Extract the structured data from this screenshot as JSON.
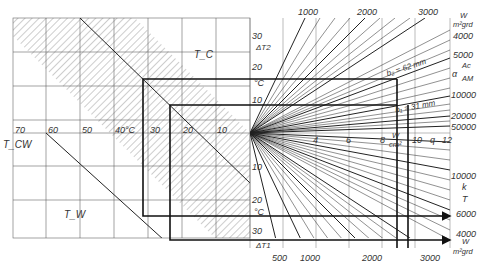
{
  "diagram": {
    "type": "nomogram",
    "left_panel": {
      "x_axis_ticks": [
        "70",
        "60",
        "50",
        "40°C",
        "30",
        "20",
        "10"
      ],
      "labels": {
        "t_c": "T_C",
        "t_cw": "T_CW",
        "t_w": "T_W"
      }
    },
    "center_axis": {
      "upper_ticks": [
        "30",
        "20",
        "10"
      ],
      "upper_label": "ΔT2",
      "upper_unit": "°C",
      "lower_ticks": [
        "10",
        "20",
        "30"
      ],
      "lower_label": "ΔT1",
      "lower_unit": "°C"
    },
    "right_panel": {
      "q_axis_ticks": [
        "4",
        "6",
        "8",
        "10",
        "q",
        "12"
      ],
      "q_unit_num": "W",
      "q_unit_den": "cm²",
      "top_ticks": [
        "1000",
        "2000",
        "3000"
      ],
      "top_unit_num": "W",
      "top_unit_den": "m²grd",
      "right_upper_ticks": [
        "4000",
        "5000",
        "10000",
        "20000",
        "50000"
      ],
      "alpha_label": "α",
      "ratio_num": "Ac",
      "ratio_den": "AM",
      "b2_label": "b₂ = 62 mm",
      "b1_label": "b₁ = 31 mm",
      "right_lower_ticks": [
        "10000",
        "6000",
        "4000"
      ],
      "k_label_num": "k",
      "k_label_den": "T",
      "bottom_ticks": [
        "500",
        "1000",
        "2000",
        "3000"
      ],
      "bottom_unit_num": "W",
      "bottom_unit_den": "m²grd"
    }
  }
}
